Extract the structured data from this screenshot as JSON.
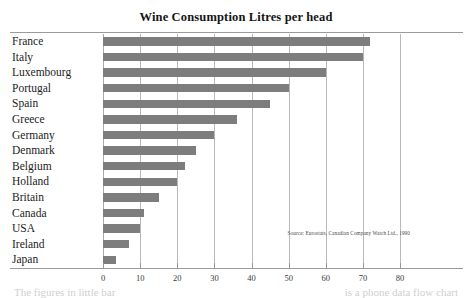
{
  "chart_data": {
    "type": "bar",
    "orientation": "horizontal",
    "title": "Wine Consumption Litres per head",
    "xlabel": "",
    "ylabel": "",
    "xlim": [
      0,
      80
    ],
    "xticks": [
      0,
      10,
      20,
      30,
      40,
      50,
      60,
      70,
      80
    ],
    "grid": true,
    "legend": false,
    "bar_color": "#7d7d7d",
    "categories": [
      "France",
      "Italy",
      "Luxembourg",
      "Portugal",
      "Spain",
      "Greece",
      "Germany",
      "Denmark",
      "Belgium",
      "Holland",
      "Britain",
      "Canada",
      "USA",
      "Ireland",
      "Japan"
    ],
    "values": [
      72,
      70,
      60,
      50,
      45,
      36,
      30,
      25,
      22,
      20,
      15,
      11,
      10,
      7,
      3.5
    ],
    "annotations": [
      "Source: Eurostats, Canadian Company Watch Ltd., 1990"
    ]
  },
  "figure": {
    "title": "Wine Consumption Litres per head",
    "source_note": "Source: Eurostats, Canadian Company Watch Ltd., 1990",
    "page_bleed_left": "The figures in little bar",
    "page_bleed_right": "is a phone data flow chart"
  }
}
